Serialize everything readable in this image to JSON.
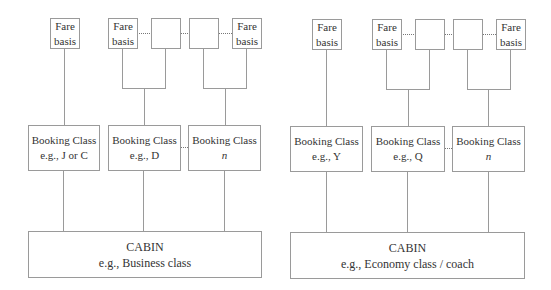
{
  "left": {
    "fare_boxes": [
      {
        "line1": "Fare",
        "line2": "basis"
      },
      {
        "line1": "Fare",
        "line2": "basis"
      },
      {
        "line1": "",
        "line2": ""
      },
      {
        "line1": "",
        "line2": ""
      },
      {
        "line1": "Fare",
        "line2": "basis"
      }
    ],
    "booking": [
      {
        "title": "Booking Class",
        "sub": "e.g., J or C"
      },
      {
        "title": "Booking Class",
        "sub": "e.g., D"
      },
      {
        "title": "Booking Class",
        "sub": "n"
      }
    ],
    "cabin": {
      "title": "CABIN",
      "sub": "e.g., Business class"
    }
  },
  "right": {
    "fare_boxes": [
      {
        "line1": "Fare",
        "line2": "basis"
      },
      {
        "line1": "Fare",
        "line2": "basis"
      },
      {
        "line1": "",
        "line2": ""
      },
      {
        "line1": "",
        "line2": ""
      },
      {
        "line1": "Fare",
        "line2": "basis"
      }
    ],
    "booking": [
      {
        "title": "Booking Class",
        "sub": "e.g., Y"
      },
      {
        "title": "Booking Class",
        "sub": "e.g., Q"
      },
      {
        "title": "Booking Class",
        "sub": "n"
      }
    ],
    "cabin": {
      "title": "CABIN",
      "sub": "e.g., Economy class / coach"
    }
  }
}
